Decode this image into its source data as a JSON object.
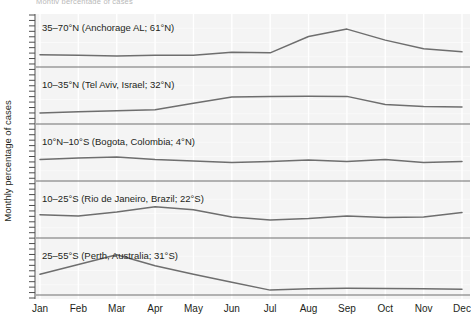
{
  "caption_remnant": "Montly percentage of cases",
  "y_axis_title": "Monthly percentage of cases",
  "legend_header": "Latitude",
  "chart_data": {
    "type": "line",
    "title": "",
    "subtitle": "",
    "xlabel": "",
    "ylabel": "Monthly percentage of cases",
    "legend_position": "top-left",
    "grid": true,
    "grid_orientation": "vertical",
    "panel_layout": "stacked-small-multiples",
    "x": [
      "Jan",
      "Feb",
      "Mar",
      "Apr",
      "May",
      "Jun",
      "Jul",
      "Aug",
      "Sep",
      "Oct",
      "Nov",
      "Dec"
    ],
    "categories": [
      "Jan",
      "Feb",
      "Mar",
      "Apr",
      "May",
      "Jun",
      "Jul",
      "Aug",
      "Sep",
      "Oct",
      "Nov",
      "Dec"
    ],
    "ylim": [
      0,
      20
    ],
    "yticks_labeled": false,
    "series": [
      {
        "name": "35–70°N (Anchorage AL; 61°N)",
        "latitude_band": "35–70°N",
        "city": "Anchorage AL",
        "latitude": "61°N",
        "hemisphere": "north",
        "panel": 1,
        "values": [
          5.0,
          4.8,
          4.5,
          4.8,
          4.8,
          6.0,
          5.8,
          12.5,
          15.5,
          11.0,
          7.5,
          6.2
        ],
        "peak_month": "Sep",
        "trough_month": "Mar"
      },
      {
        "name": "10–35°N (Tel Aviv, Israel; 32°N)",
        "latitude_band": "10–35°N",
        "city": "Tel Aviv, Israel",
        "latitude": "32°N",
        "hemisphere": "north",
        "panel": 2,
        "values": [
          4.5,
          5.0,
          5.4,
          5.8,
          8.5,
          11.0,
          11.3,
          11.4,
          11.3,
          8.0,
          7.2,
          7.0
        ],
        "peak_month": "Aug",
        "trough_month": "Jan"
      },
      {
        "name": "10°N–10°S (Bogota, Colombia; 4°N)",
        "latitude_band": "10°N–10°S",
        "city": "Bogota, Colombia",
        "latitude": "4°N",
        "hemisphere": "equatorial",
        "panel": 3,
        "values": [
          8.8,
          9.4,
          9.8,
          8.8,
          8.2,
          7.6,
          8.0,
          8.6,
          8.0,
          8.8,
          7.6,
          8.0
        ],
        "peak_month": "Mar",
        "trough_month": "Jun"
      },
      {
        "name": "10–25°S (Rio de Janeiro, Brazil; 22°S)",
        "latitude_band": "10–25°S",
        "city": "Rio de Janeiro, Brazil",
        "latitude": "22°S",
        "hemisphere": "south",
        "panel": 4,
        "values": [
          9.5,
          9.0,
          10.6,
          12.8,
          11.6,
          8.6,
          7.4,
          8.0,
          9.0,
          8.4,
          8.6,
          10.4
        ],
        "peak_month": "Apr",
        "trough_month": "Jul"
      },
      {
        "name": "25–55°S (Perth, Australia; 31°S)",
        "latitude_band": "25–55°S",
        "city": "Perth, Australia",
        "latitude": "31°S",
        "hemisphere": "south",
        "panel": 5,
        "values": [
          8.5,
          12.5,
          16.5,
          12.0,
          8.5,
          5.2,
          2.0,
          2.6,
          2.8,
          2.7,
          2.6,
          2.4
        ],
        "peak_month": "Mar",
        "trough_month": "Jul"
      }
    ]
  },
  "colors": {
    "line": "#6e6e6e",
    "baseline": "#6e6e6e",
    "gridline": "#ffffff",
    "plot_background": "#f4f4f4",
    "text": "#231f20",
    "axis": "#4d4d4d"
  }
}
